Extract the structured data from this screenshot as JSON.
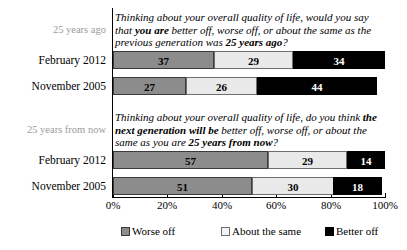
{
  "chart_data": {
    "type": "bar",
    "orientation": "horizontal",
    "stacked": true,
    "percent": true,
    "xlabel": "",
    "ylabel": "",
    "xlim": [
      0,
      100
    ],
    "grid": false,
    "legend_position": "bottom",
    "tick_labels": [
      "0%",
      "20%",
      "40%",
      "60%",
      "80%",
      "100%"
    ],
    "tick_values": [
      0,
      20,
      40,
      60,
      80,
      100
    ],
    "legend": [
      {
        "name": "Worse off",
        "color": "#8c8c8c"
      },
      {
        "name": "About the same",
        "color": "#e9e9e9"
      },
      {
        "name": "Better off",
        "color": "#000000"
      }
    ],
    "series": [
      {
        "name": "Worse off",
        "color": "#8c8c8c"
      },
      {
        "name": "About the same",
        "color": "#e9e9e9"
      },
      {
        "name": "Better off",
        "color": "#000000"
      }
    ],
    "panels": [
      {
        "group_label": "25 years ago",
        "question_plain": "Thinking about your overall quality of life, would you say that you are better off, worse off, or about the same as the previous generation was 25 years ago?",
        "question_parts": [
          {
            "text": "Thinking about your overall quality of life, would you say that ",
            "bold": false
          },
          {
            "text": "you are",
            "bold": true
          },
          {
            "text": " better off, worse off, or about the same as the previous generation was ",
            "bold": false
          },
          {
            "text": "25 years ago",
            "bold": true
          },
          {
            "text": "?",
            "bold": false
          }
        ],
        "categories": [
          "February 2012",
          "November 2005"
        ],
        "rows": [
          {
            "label": "February 2012",
            "values": [
              37,
              29,
              34
            ]
          },
          {
            "label": "November 2005",
            "values": [
              27,
              26,
              44
            ]
          }
        ]
      },
      {
        "group_label": "25 years from now",
        "question_plain": "Thinking about your overall quality of life, do you think the next generation will be better off, worse off, or about the same as you are 25 years from now?",
        "question_parts": [
          {
            "text": "Thinking about your overall quality of life, do you think ",
            "bold": false
          },
          {
            "text": "the next generation will be",
            "bold": true
          },
          {
            "text": " better off, worse off, or about the same as you are ",
            "bold": false
          },
          {
            "text": "25 years from now",
            "bold": true
          },
          {
            "text": "?",
            "bold": false
          }
        ],
        "categories": [
          "February 2012",
          "November 2005"
        ],
        "rows": [
          {
            "label": "February 2012",
            "values": [
              57,
              29,
              14
            ]
          },
          {
            "label": "November 2005",
            "values": [
              51,
              30,
              18
            ]
          }
        ]
      }
    ]
  }
}
